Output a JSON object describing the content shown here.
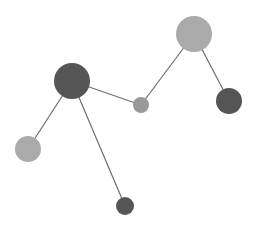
{
  "graph": {
    "width": 259,
    "height": 231,
    "background": "#ffffff",
    "edge_color": "#6e6e6e",
    "nodes": [
      {
        "id": "n1",
        "x": 72,
        "y": 81,
        "r": 18,
        "color": "#555555"
      },
      {
        "id": "n2",
        "x": 194,
        "y": 34,
        "r": 18,
        "color": "#aaaaaa"
      },
      {
        "id": "n3",
        "x": 141,
        "y": 105,
        "r": 8,
        "color": "#999999"
      },
      {
        "id": "n4",
        "x": 229,
        "y": 101,
        "r": 13,
        "color": "#555555"
      },
      {
        "id": "n5",
        "x": 28,
        "y": 149,
        "r": 13,
        "color": "#aaaaaa"
      },
      {
        "id": "n6",
        "x": 125,
        "y": 206,
        "r": 9,
        "color": "#555555"
      }
    ],
    "edges": [
      {
        "source": "n1",
        "target": "n3"
      },
      {
        "source": "n3",
        "target": "n2"
      },
      {
        "source": "n2",
        "target": "n4"
      },
      {
        "source": "n1",
        "target": "n5"
      },
      {
        "source": "n1",
        "target": "n6"
      }
    ]
  }
}
